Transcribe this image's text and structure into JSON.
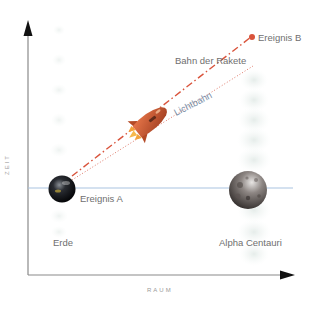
{
  "diagram": {
    "type": "spacetime-diagram",
    "axes": {
      "y_label": "ZEIT",
      "x_label": "RAUM"
    },
    "bodies": [
      {
        "name": "Erde",
        "style": "dark-planet"
      },
      {
        "name": "Alpha Centauri",
        "style": "cratered-moon"
      }
    ],
    "events": [
      {
        "label": "Ereignis A",
        "on": "Erde"
      },
      {
        "label": "Ereignis B",
        "marker_color": "#d9533b"
      }
    ],
    "paths": [
      {
        "label": "Bahn der Rakete",
        "style": "dash-dot",
        "color": "#d9533b"
      },
      {
        "label": "Lichtbahn",
        "style": "dotted",
        "color": "#e07a6a"
      }
    ],
    "simultaneity_line_color": "#a9c3e0",
    "object": "rocket"
  }
}
